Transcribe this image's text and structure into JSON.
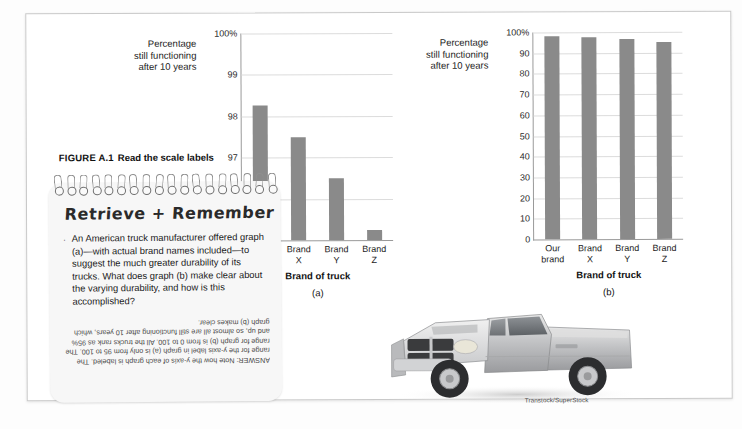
{
  "figure": {
    "number": "FIGURE A.1",
    "title": "Read the scale labels"
  },
  "notepad": {
    "title": "Retrieve + Remember",
    "bullet_marker": "·",
    "body": "An American truck manufacturer offered graph (a)—with actual brand names included—to suggest the much greater durability of its trucks. What does graph (b) make clear about the varying durability, and how is this accomplished?",
    "answer": "ANSWER: Note how the y-axis of each graph is labeled. The range for the y-axis label in graph (a) is only from 95 to 100. The range for graph (b) is from 0 to 100. All the trucks rank as 95% and up, so almost all are still functioning after 10 years, which graph (b) makes clear."
  },
  "photo": {
    "credit": "Transtock/SuperStock",
    "subject": "silver pickup truck"
  },
  "colors": {
    "bar": "#8a8a8a",
    "axis": "#9a9a9a",
    "grid": "#dcdcdc",
    "page_border": "#c9c9c9",
    "notepad_bg": "#f7f7f7"
  },
  "chart_data": [
    {
      "type": "bar",
      "panel": "(a)",
      "title": "",
      "ylabel": "Percentage still functioning after 10 years",
      "ylabel_lines": [
        "Percentage",
        "still functioning",
        "after 10 years"
      ],
      "xlabel": "Brand of truck",
      "categories": [
        "Our brand",
        "Brand X",
        "Brand Y",
        "Brand Z"
      ],
      "category_lines": [
        [
          "Our",
          "brand"
        ],
        [
          "Brand",
          "X"
        ],
        [
          "Brand",
          "Y"
        ],
        [
          "Brand",
          "Z"
        ]
      ],
      "values": [
        98.25,
        97.5,
        96.5,
        95.25
      ],
      "ylim": [
        95,
        100
      ],
      "yticks": [
        95,
        96,
        97,
        98,
        99,
        100
      ],
      "yticklabels": [
        "95",
        "96",
        "97",
        "98",
        "99",
        "100%"
      ],
      "grid": true,
      "legend": "none"
    },
    {
      "type": "bar",
      "panel": "(b)",
      "title": "",
      "ylabel": "Percentage still functioning after 10 years",
      "ylabel_lines": [
        "Percentage",
        "still functioning",
        "after 10 years"
      ],
      "xlabel": "Brand of truck",
      "categories": [
        "Our brand",
        "Brand X",
        "Brand Y",
        "Brand Z"
      ],
      "category_lines": [
        [
          "Our",
          "brand"
        ],
        [
          "Brand",
          "X"
        ],
        [
          "Brand",
          "Y"
        ],
        [
          "Brand",
          "Z"
        ]
      ],
      "values": [
        98.25,
        97.5,
        96.5,
        95.25
      ],
      "ylim": [
        0,
        100
      ],
      "yticks": [
        0,
        10,
        20,
        30,
        40,
        50,
        60,
        70,
        80,
        90,
        100
      ],
      "yticklabels": [
        "0",
        "10",
        "20",
        "30",
        "40",
        "50",
        "60",
        "70",
        "80",
        "90",
        "100%"
      ],
      "grid": true,
      "legend": "none"
    }
  ]
}
